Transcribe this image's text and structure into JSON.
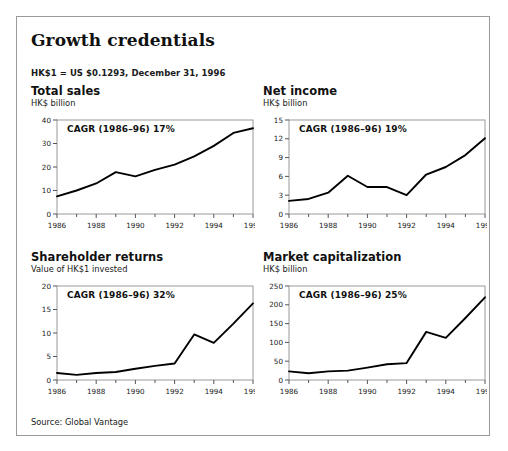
{
  "exhibit": {
    "title": "Growth credentials",
    "fx_note": "HK$1 = US $0.1293, December 31, 1996",
    "source": "Source: Global Vantage"
  },
  "chart_data": [
    {
      "type": "line",
      "title": "Total sales",
      "ylabel": "HK$ billion",
      "xlabel": "",
      "annotation": "CAGR (1986–96) 17%",
      "x": [
        1986,
        1987,
        1988,
        1989,
        1990,
        1991,
        1992,
        1993,
        1994,
        1995,
        1996
      ],
      "values": [
        7.5,
        10.0,
        13.0,
        17.8,
        16.0,
        18.8,
        21.0,
        24.5,
        29.0,
        34.5,
        36.5
      ],
      "xticks": [
        "1986",
        "1988",
        "1990",
        "1992",
        "1994",
        "1996"
      ],
      "yticks": [
        "0",
        "10",
        "20",
        "30",
        "40"
      ],
      "xlim": [
        1986,
        1996
      ],
      "ylim": [
        0,
        40
      ],
      "grid": false,
      "legend": "none"
    },
    {
      "type": "line",
      "title": "Net income",
      "ylabel": "HK$ billion",
      "xlabel": "",
      "annotation": "CAGR (1986–96) 19%",
      "x": [
        1986,
        1987,
        1988,
        1989,
        1990,
        1991,
        1992,
        1993,
        1994,
        1995,
        1996
      ],
      "values": [
        2.1,
        2.4,
        3.4,
        6.1,
        4.3,
        4.3,
        3.0,
        6.3,
        7.5,
        9.4,
        12.1
      ],
      "xticks": [
        "1986",
        "1988",
        "1990",
        "1992",
        "1994",
        "1996"
      ],
      "yticks": [
        "0",
        "3",
        "6",
        "9",
        "12",
        "15"
      ],
      "xlim": [
        1986,
        1996
      ],
      "ylim": [
        0,
        15
      ],
      "grid": false,
      "legend": "none"
    },
    {
      "type": "line",
      "title": "Shareholder returns",
      "ylabel": "Value of HK$1 invested",
      "xlabel": "",
      "annotation": "CAGR (1986–96) 32%",
      "x": [
        1986,
        1987,
        1988,
        1989,
        1990,
        1991,
        1992,
        1993,
        1994,
        1995,
        1996
      ],
      "values": [
        1.5,
        1.1,
        1.5,
        1.7,
        2.4,
        3.0,
        3.5,
        9.7,
        7.9,
        12.0,
        16.3
      ],
      "xticks": [
        "1986",
        "1988",
        "1990",
        "1992",
        "1994",
        "1996"
      ],
      "yticks": [
        "0",
        "5",
        "10",
        "15",
        "20"
      ],
      "xlim": [
        1986,
        1996
      ],
      "ylim": [
        0,
        20
      ],
      "grid": false,
      "legend": "none"
    },
    {
      "type": "line",
      "title": "Market capitalization",
      "ylabel": "HK$ billion",
      "xlabel": "",
      "annotation": "CAGR (1986–96) 25%",
      "x": [
        1986,
        1987,
        1988,
        1989,
        1990,
        1991,
        1992,
        1993,
        1994,
        1995,
        1996
      ],
      "values": [
        23,
        18,
        23,
        25,
        33,
        42,
        45,
        128,
        112,
        165,
        220
      ],
      "xticks": [
        "1986",
        "1988",
        "1990",
        "1992",
        "1994",
        "1996"
      ],
      "yticks": [
        "0",
        "50",
        "100",
        "150",
        "200",
        "250"
      ],
      "xlim": [
        1986,
        1996
      ],
      "ylim": [
        0,
        250
      ],
      "grid": false,
      "legend": "none"
    }
  ],
  "colors": {
    "line": "#000000",
    "axis": "#55555a",
    "frame": "#9a9a9a",
    "text": "#1a1a1a"
  }
}
